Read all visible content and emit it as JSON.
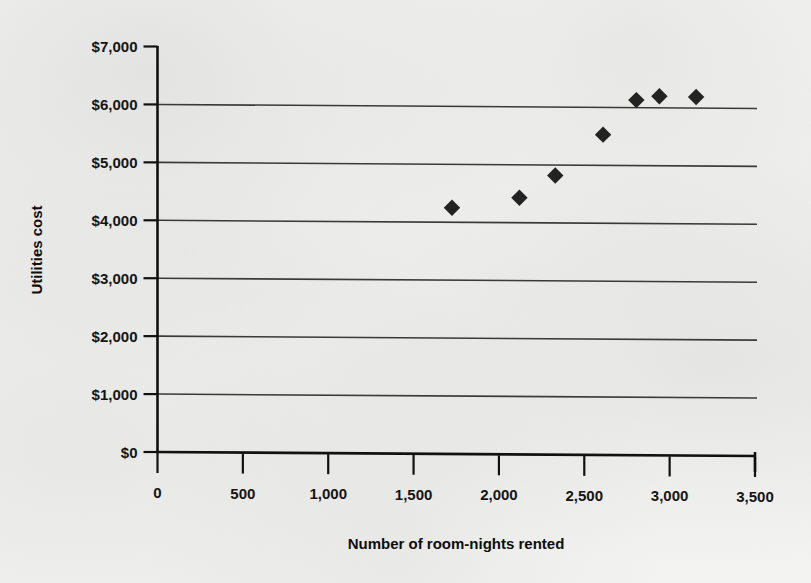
{
  "figure": {
    "background_color": "#f2f2f0",
    "ink_color": "#151515"
  },
  "axis": {
    "y_title": "Utilities cost",
    "x_title": "Number of room-nights rented"
  },
  "chart_data": {
    "type": "scatter",
    "title": "",
    "subtitle": "",
    "xlabel": "Number of room-nights rented",
    "ylabel": "Utilities cost",
    "xlim": [
      0,
      3500
    ],
    "ylim": [
      0,
      7000
    ],
    "grid": "horizontal",
    "legend": "none",
    "x_ticks": [
      0,
      500,
      1000,
      1500,
      2000,
      2500,
      3000,
      3500
    ],
    "x_tick_labels": [
      "0",
      "500",
      "1,000",
      "1,500",
      "2,000",
      "2,500",
      "3,000",
      "3,500"
    ],
    "y_ticks": [
      0,
      1000,
      2000,
      3000,
      4000,
      5000,
      6000,
      7000
    ],
    "y_tick_labels": [
      "$0",
      "$1,000",
      "$2,000",
      "$3,000",
      "$4,000",
      "$5,000",
      "$6,000",
      "$7,000"
    ],
    "marker": "diamond",
    "marker_color": "#232323",
    "points": [
      {
        "x": 1725,
        "y": 4250
      },
      {
        "x": 2120,
        "y": 4430
      },
      {
        "x": 2330,
        "y": 4820
      },
      {
        "x": 2610,
        "y": 5530
      },
      {
        "x": 2805,
        "y": 6130
      },
      {
        "x": 2940,
        "y": 6200
      },
      {
        "x": 3155,
        "y": 6190
      }
    ]
  }
}
